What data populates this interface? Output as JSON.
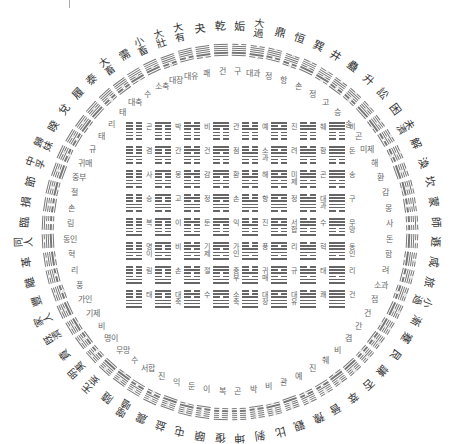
{
  "header": {
    "cut_off_text": "· · · · · · · · · · · · · · · · · · · · · · · · · · · ·"
  },
  "diagram": {
    "center": [
      230,
      232
    ],
    "outer_label_radius": 205,
    "ring_radius": 182,
    "inner_label_radius": 160,
    "colors": {
      "line": "#777777",
      "text": "#333333",
      "inner_text": "#666666",
      "background": "#ffffff"
    },
    "outer_labels_hanja": [
      "乾",
      "夬",
      "大有",
      "大壯",
      "小畜",
      "需",
      "大畜",
      "泰",
      "履",
      "兌",
      "睽",
      "歸妹",
      "中孚",
      "節",
      "損",
      "臨",
      "同人",
      "革",
      "離",
      "豐",
      "家人",
      "既濟",
      "賁",
      "明夷",
      "无妄",
      "隨",
      "噬嗑",
      "震",
      "益",
      "屯",
      "頤",
      "復",
      "姤",
      "大過",
      "鼎",
      "恒",
      "巽",
      "井",
      "蠱",
      "升",
      "訟",
      "困",
      "未濟",
      "解",
      "渙",
      "坎",
      "蒙",
      "師",
      "遯",
      "咸",
      "旅",
      "小過",
      "漸",
      "蹇",
      "艮",
      "謙",
      "否",
      "萃",
      "晉",
      "豫",
      "觀",
      "比",
      "剝",
      "坤"
    ],
    "inner_labels_korean": [
      "건",
      "쾌",
      "대유",
      "대장",
      "소축",
      "수",
      "대축",
      "태",
      "리",
      "태",
      "규",
      "귀매",
      "중부",
      "절",
      "손",
      "림",
      "동인",
      "혁",
      "리",
      "풍",
      "가인",
      "기제",
      "비",
      "명이",
      "무망",
      "수",
      "서합",
      "진",
      "익",
      "둔",
      "이",
      "복",
      "구",
      "대과",
      "정",
      "항",
      "손",
      "정",
      "고",
      "승",
      "송",
      "곤",
      "미제",
      "해",
      "환",
      "감",
      "몽",
      "사",
      "돈",
      "함",
      "려",
      "소과",
      "점",
      "건",
      "간",
      "겸",
      "비",
      "췌",
      "진",
      "예",
      "관",
      "비",
      "박",
      "곤"
    ],
    "square_grid": {
      "origin": [
        126,
        121
      ],
      "cell_size": [
        29,
        24
      ],
      "rows": [
        [
          "곤",
          "박",
          "비",
          "관",
          "예",
          "진",
          "췌",
          "비"
        ],
        [
          "겸",
          "간",
          "건",
          "점",
          "소과",
          "려",
          "함",
          "돈"
        ],
        [
          "사",
          "몽",
          "감",
          "환",
          "해",
          "미제",
          "곤",
          "송"
        ],
        [
          "승",
          "고",
          "정",
          "손",
          "항",
          "정",
          "대과",
          "구"
        ],
        [
          "복",
          "이",
          "둔",
          "익",
          "진",
          "서합",
          "수",
          "무망"
        ],
        [
          "명이",
          "비",
          "기제",
          "가인",
          "풍",
          "리",
          "혁",
          "동인"
        ],
        [
          "림",
          "손",
          "절",
          "중부",
          "귀매",
          "규",
          "태",
          "리"
        ],
        [
          "태",
          "대축",
          "수",
          "소축",
          "대장",
          "대유",
          "쾌",
          "건"
        ]
      ]
    }
  }
}
